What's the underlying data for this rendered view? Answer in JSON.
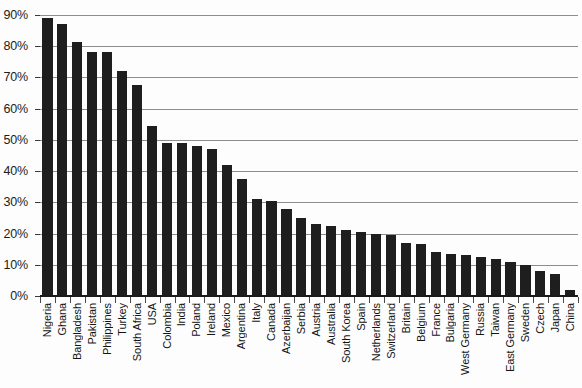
{
  "chart_data": {
    "type": "bar",
    "title": "",
    "subtitle": "",
    "xlabel": "",
    "ylabel": "",
    "ylim": [
      0,
      90
    ],
    "ytick_values": [
      0,
      10,
      20,
      30,
      40,
      50,
      60,
      70,
      80,
      90
    ],
    "ytick_labels": [
      "0%",
      "10%",
      "20%",
      "30%",
      "40%",
      "50%",
      "60%",
      "70%",
      "80%",
      "90%"
    ],
    "grid": true,
    "legend": "none",
    "orientation": "vertical",
    "bar_color": "#1e1e1e",
    "grid_color": "#8d8d8d",
    "axis_color": "#1a1a1a",
    "categories": [
      "Nigeria",
      "Ghana",
      "Bangladesh",
      "Pakistan",
      "Philippines",
      "Turkey",
      "South Africa",
      "USA",
      "Colombia",
      "India",
      "Poland",
      "Ireland",
      "Mexico",
      "Argentina",
      "Italy",
      "Canada",
      "Azerbaijan",
      "Serbia",
      "Austria",
      "Australia",
      "South Korea",
      "Spain",
      "Netherlands",
      "Switzerland",
      "Britain",
      "Belgium",
      "France",
      "Bulgaria",
      "West Germany",
      "Russia",
      "Taiwan",
      "East Germany",
      "Sweden",
      "Czech",
      "Japan",
      "China"
    ],
    "values": [
      89,
      87,
      81.5,
      78,
      78,
      72,
      67.5,
      54.5,
      49,
      49,
      48,
      47,
      42,
      37.5,
      31,
      30.5,
      28,
      25,
      23,
      22.5,
      21,
      20.5,
      20,
      19.5,
      17,
      16.5,
      14,
      13.5,
      13,
      12.5,
      12,
      11,
      10,
      8,
      7,
      2
    ]
  }
}
